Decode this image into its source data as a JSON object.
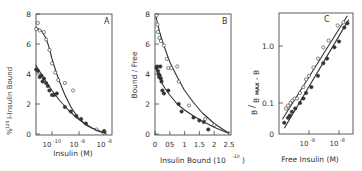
{
  "figure": {
    "panels": [
      "A",
      "B",
      "C"
    ]
  },
  "chart_data": [
    {
      "type": "scatter",
      "panel_label": "A",
      "title": "",
      "xlabel": "Insulin (M)",
      "ylabel": "% 125I-Insulin Bound",
      "xscale": "log",
      "xlim": [
        2.5e-11,
        1.4e-08
      ],
      "ylim": [
        0,
        8
      ],
      "xticks": [
        "10^-10",
        "10^-9",
        "10^-8"
      ],
      "yticks": [
        0,
        2,
        4,
        6,
        8
      ],
      "series": [
        {
          "name": "open circles",
          "marker": "open-circle",
          "x": [
            2.6e-11,
            3e-11,
            3.5e-11,
            5e-11,
            6e-11,
            8e-11,
            1e-10,
            1.3e-10,
            1.7e-10,
            3e-10,
            6e-10,
            4.5e-09,
            8e-09
          ],
          "y": [
            7.0,
            7.4,
            6.9,
            6.8,
            6.3,
            5.6,
            4.7,
            4.1,
            3.6,
            3.4,
            2.9,
            0.3,
            0.1
          ],
          "fit_curve": {
            "x": [
              2.5e-11,
              4e-11,
              6e-11,
              8e-11,
              1e-10,
              1.5e-10,
              2e-10,
              3e-10,
              5e-10,
              1e-09,
              2e-09,
              4e-09,
              1e-08
            ],
            "y": [
              7.1,
              6.9,
              6.4,
              5.7,
              5.0,
              4.0,
              3.4,
              2.6,
              1.8,
              1.0,
              0.55,
              0.3,
              0.05
            ]
          }
        },
        {
          "name": "filled circles",
          "marker": "filled-circle",
          "x": [
            2.6e-11,
            3e-11,
            3.5e-11,
            4e-11,
            4.5e-11,
            5e-11,
            6e-11,
            7e-11,
            8e-11,
            1e-10,
            1.2e-10,
            1.5e-10,
            3e-10,
            5e-10,
            8e-10,
            1.2e-09,
            1.8e-09,
            8.5e-09
          ],
          "y": [
            4.3,
            4.2,
            3.8,
            3.9,
            3.5,
            3.7,
            3.4,
            3.2,
            2.9,
            2.6,
            2.6,
            2.7,
            1.8,
            1.5,
            1.2,
            1.0,
            0.7,
            0.2
          ],
          "fit_curve": {
            "x": [
              2.5e-11,
              4e-11,
              6e-11,
              1e-10,
              2e-10,
              4e-10,
              8e-10,
              1.5e-09,
              3e-09,
              6e-09,
              1e-08
            ],
            "y": [
              4.6,
              4.0,
              3.5,
              2.9,
              2.2,
              1.6,
              1.1,
              0.75,
              0.4,
              0.15,
              0.05
            ]
          }
        }
      ]
    },
    {
      "type": "scatter",
      "panel_label": "B",
      "title": "",
      "xlabel": "Insulin Bound (10^-10)",
      "ylabel": "Bound / Free",
      "xlim": [
        0,
        2.55
      ],
      "ylim": [
        0,
        8
      ],
      "xticks": [
        "0",
        "0.5",
        "1",
        "1.5",
        "2",
        "2.5"
      ],
      "yticks": [
        0,
        2,
        4,
        6,
        8
      ],
      "series": [
        {
          "name": "open circles",
          "marker": "open-circle",
          "x": [
            0.05,
            0.08,
            0.1,
            0.15,
            0.2,
            0.3,
            0.4,
            0.45,
            0.55,
            0.75,
            0.8,
            1.15,
            1.7,
            2.0
          ],
          "y": [
            7.9,
            7.3,
            6.8,
            6.4,
            6.2,
            5.9,
            5.0,
            4.4,
            4.4,
            4.5,
            3.5,
            1.9,
            1.0,
            0.6
          ],
          "fit_curve": {
            "x": [
              0.02,
              0.1,
              0.2,
              0.35,
              0.5,
              0.75,
              1.0,
              1.3,
              1.6,
              2.0,
              2.3,
              2.5
            ],
            "y": [
              8.0,
              7.2,
              6.5,
              5.6,
              4.8,
              3.8,
              2.9,
              2.1,
              1.4,
              0.7,
              0.3,
              0.05
            ]
          }
        },
        {
          "name": "filled circles",
          "marker": "filled-circle",
          "x": [
            0.05,
            0.08,
            0.1,
            0.12,
            0.14,
            0.16,
            0.18,
            0.2,
            0.22,
            0.25,
            0.3,
            0.45,
            0.8,
            0.9,
            1.3,
            1.5,
            1.65,
            1.8
          ],
          "y": [
            4.4,
            4.5,
            4.2,
            4.0,
            3.8,
            3.9,
            4.5,
            3.7,
            3.5,
            2.9,
            2.7,
            2.9,
            2.0,
            1.5,
            1.1,
            0.9,
            0.8,
            0.3
          ],
          "fit_curve": {
            "x": [
              0.02,
              0.1,
              0.2,
              0.35,
              0.5,
              0.75,
              1.0,
              1.3,
              1.6,
              2.0,
              2.3,
              2.5
            ],
            "y": [
              4.6,
              4.0,
              3.5,
              3.0,
              2.6,
              2.0,
              1.6,
              1.2,
              0.85,
              0.45,
              0.2,
              0.05
            ]
          }
        }
      ]
    },
    {
      "type": "scatter",
      "panel_label": "C",
      "title": "",
      "xlabel": "Free Insulin (M)",
      "ylabel": "B / (Bmax - B)",
      "xscale": "log",
      "yscale": "log",
      "xlim": [
        1.2e-10,
        2.2e-08
      ],
      "ylim": [
        0.029,
        3.8
      ],
      "xticks": [
        "10^-9",
        "10^-8"
      ],
      "yticks": [
        "0",
        "0.1",
        "1.0"
      ],
      "series": [
        {
          "name": "open circles",
          "marker": "open-circle",
          "x": [
            1.7e-10,
            2e-10,
            2.4e-10,
            2.8e-10,
            3.3e-10,
            4e-10,
            5e-10,
            6.5e-10,
            8e-10,
            1e-09,
            1.4e-09,
            2e-09,
            3e-09,
            4.5e-09,
            9e-09,
            1.4e-08
          ],
          "y": [
            0.08,
            0.09,
            0.1,
            0.11,
            0.12,
            0.12,
            0.15,
            0.19,
            0.26,
            0.3,
            0.42,
            0.6,
            0.95,
            1.25,
            2.3,
            2.6
          ],
          "fit_line": {
            "x": [
              1.3e-10,
              1.9e-08
            ],
            "y": [
              0.052,
              3.4
            ]
          }
        },
        {
          "name": "filled circles",
          "marker": "filled-circle",
          "x": [
            1.5e-10,
            2e-10,
            2.3e-10,
            2.7e-10,
            3.5e-10,
            5e-10,
            6.5e-10,
            8e-10,
            1.2e-09,
            2e-09,
            3e-09,
            4e-09,
            7e-09,
            1e-08,
            1.5e-08,
            1.9e-08
          ],
          "y": [
            0.045,
            0.055,
            0.06,
            0.07,
            0.08,
            0.1,
            0.12,
            0.15,
            0.19,
            0.3,
            0.5,
            0.6,
            0.95,
            1.2,
            2.1,
            2.5
          ],
          "fit_line": {
            "x": [
              1.5e-10,
              2.1e-08
            ],
            "y": [
              0.036,
              2.9
            ]
          }
        }
      ]
    }
  ],
  "labels": {
    "A": {
      "panel": "A",
      "ylabel_sup": "125",
      "ylabel_pre": "%",
      "ylabel_main": "I-Insulin  Bound",
      "xlabel": "Insulin (M)",
      "yticks": [
        "0",
        "2",
        "4",
        "6",
        "8"
      ],
      "xticks": [
        {
          "base": "10",
          "exp": "-10"
        },
        {
          "base": "10",
          "exp": "-9"
        },
        {
          "base": "10",
          "exp": "-8"
        }
      ]
    },
    "B": {
      "panel": "B",
      "ylabel": "Bound / Free",
      "xlabel_main": "Insulin Bound (10",
      "xlabel_exp": "-10",
      "xlabel_end": ")",
      "yticks": [
        "0",
        "2",
        "4",
        "6",
        "8"
      ],
      "xticks": [
        "0",
        "05",
        "1",
        "1.5",
        "2",
        "2.5"
      ]
    },
    "C": {
      "panel": "C",
      "ylabel_b": "B",
      "ylabel_slash": "/",
      "ylabel_b2": "B",
      "ylabel_max": "MAX",
      "ylabel_end": "- B",
      "xlabel": "Free Insulin (M)",
      "yticks": [
        "0",
        "0.1",
        "1.0"
      ],
      "xticks": [
        {
          "base": "10",
          "exp": "-9"
        },
        {
          "base": "10",
          "exp": "-8"
        }
      ]
    }
  },
  "colors": {
    "ink": "#333333",
    "background": "#ffffff"
  }
}
